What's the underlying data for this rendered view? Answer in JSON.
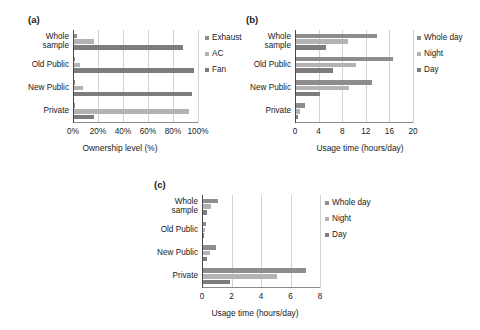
{
  "figure": {
    "background": "#ffffff",
    "series_colors": [
      "#8d8d8d",
      "#b3b3b3",
      "#7d7d7d"
    ]
  },
  "panels": [
    {
      "tag": "(a)",
      "chart_data": {
        "type": "bar",
        "orientation": "horizontal",
        "title": "",
        "xlabel": "Ownership level (%)",
        "ylabel": "",
        "xlim": [
          0,
          100
        ],
        "xticks": [
          0,
          20,
          40,
          60,
          80,
          100
        ],
        "xticklabels": [
          "0%",
          "20%",
          "40%",
          "60%",
          "80%",
          "100%"
        ],
        "grid": true,
        "legend_position": "right",
        "categories": [
          "Whole sample",
          "Old Public",
          "New Public",
          "Private"
        ],
        "series": [
          {
            "name": "Exhaust",
            "values": [
              2,
              1,
              0.5,
              0.4
            ]
          },
          {
            "name": "AC",
            "values": [
              16,
              5,
              7,
              92
            ]
          },
          {
            "name": "Fan",
            "values": [
              87,
              96,
              94,
              16
            ]
          }
        ]
      }
    },
    {
      "tag": "(b)",
      "chart_data": {
        "type": "bar",
        "orientation": "horizontal",
        "title": "",
        "xlabel": "Usage time (hours/day)",
        "ylabel": "",
        "xlim": [
          0,
          20
        ],
        "xticks": [
          0,
          4,
          8,
          12,
          16,
          20
        ],
        "xticklabels": [
          "0",
          "4",
          "8",
          "12",
          "16",
          "20"
        ],
        "grid": true,
        "legend_position": "right",
        "categories": [
          "Whole sample",
          "Old Public",
          "New Public",
          "Private"
        ],
        "series": [
          {
            "name": "Whole day",
            "values": [
              13.8,
              16.5,
              12.9,
              1.5
            ]
          },
          {
            "name": "Night",
            "values": [
              8.8,
              10.2,
              9.0,
              0.6
            ]
          },
          {
            "name": "Day",
            "values": [
              5.0,
              6.3,
              4.0,
              0.3
            ]
          }
        ]
      }
    },
    {
      "tag": "(c)",
      "chart_data": {
        "type": "bar",
        "orientation": "horizontal",
        "title": "",
        "xlabel": "Usage time (hours/day)",
        "ylabel": "",
        "xlim": [
          0,
          8
        ],
        "xticks": [
          0,
          2,
          4,
          6,
          8
        ],
        "xticklabels": [
          "0",
          "2",
          "4",
          "6",
          "8"
        ],
        "grid": true,
        "legend_position": "right",
        "categories": [
          "Whole sample",
          "Old Public",
          "New Public",
          "Private"
        ],
        "series": [
          {
            "name": "Whole day",
            "values": [
              1.05,
              0.18,
              0.85,
              7.0
            ]
          },
          {
            "name": "Night",
            "values": [
              0.55,
              0.12,
              0.45,
              5.0
            ]
          },
          {
            "name": "Day",
            "values": [
              0.3,
              0.08,
              0.25,
              1.8
            ]
          }
        ]
      }
    }
  ]
}
